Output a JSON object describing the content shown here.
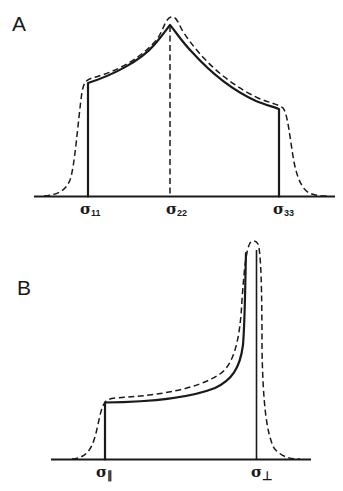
{
  "figure": {
    "panels": [
      {
        "id": "A",
        "label": "A",
        "description": "Powder pattern lineshape for axially asymmetric chemical shift tensor",
        "axis_labels": [
          {
            "symbol": "σ",
            "subscript": "11"
          },
          {
            "symbol": "σ",
            "subscript": "22"
          },
          {
            "symbol": "σ",
            "subscript": "33"
          }
        ],
        "curves": [
          {
            "name": "theoretical",
            "style": "solid"
          },
          {
            "name": "broadened",
            "style": "dashed"
          }
        ]
      },
      {
        "id": "B",
        "label": "B",
        "description": "Powder pattern lineshape for axially symmetric chemical shift tensor",
        "axis_labels": [
          {
            "symbol": "σ",
            "subscript": "∥"
          },
          {
            "symbol": "σ",
            "subscript": "⊥"
          }
        ],
        "curves": [
          {
            "name": "theoretical",
            "style": "solid"
          },
          {
            "name": "broadened",
            "style": "dashed"
          }
        ]
      }
    ],
    "colors": {
      "ink": "#1a1a1a",
      "background": "#ffffff"
    }
  }
}
